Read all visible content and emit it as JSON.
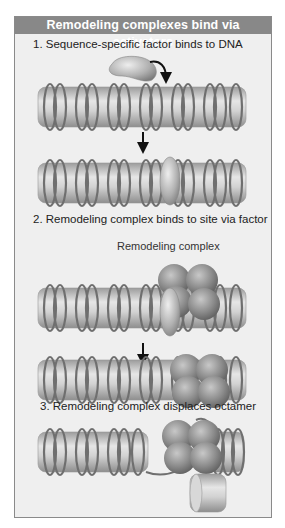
{
  "title": "Remodeling complexes bind via activators",
  "steps": [
    {
      "number": "1.",
      "text": "1. Sequence-specific factor binds to DNA"
    },
    {
      "number": "2.",
      "text": "2. Remodeling complex binds to site via factor"
    },
    {
      "number": "3.",
      "text": "3. Remodeling complex displaces octamer"
    }
  ],
  "labels": {
    "remodeling_complex": "Remodeling complex"
  },
  "colors": {
    "header_bg": "#888888",
    "panel_bg": "#efefef",
    "histone": "#cfcfcf",
    "dna": "#777777",
    "factor": "#b5b5b5",
    "complex": "#8f8f8f",
    "arrow": "#111111"
  },
  "elements": [
    "sequence-specific-factor",
    "nucleosome-fiber-1",
    "nucleosome-fiber-2-with-bound-factor",
    "nucleosome-fiber-3-with-remodeling-complex",
    "nucleosome-fiber-4-complex-slid",
    "nucleosome-fiber-5-octamer-displaced",
    "displaced-histone-octamer"
  ]
}
